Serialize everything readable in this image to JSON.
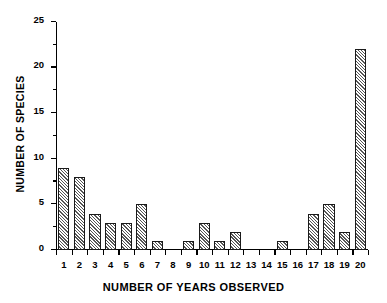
{
  "chart_data": {
    "type": "bar",
    "title": "",
    "xlabel": "NUMBER OF YEARS OBSERVED",
    "ylabel": "NUMBER OF SPECIES",
    "categories": [
      "1",
      "2",
      "3",
      "4",
      "5",
      "6",
      "7",
      "8",
      "9",
      "10",
      "11",
      "12",
      "13",
      "14",
      "15",
      "16",
      "17",
      "18",
      "19",
      "20"
    ],
    "values": [
      9,
      8,
      4,
      3,
      3,
      5,
      1,
      0,
      1,
      3,
      1,
      2,
      0,
      0,
      1,
      0,
      4,
      5,
      2,
      22
    ],
    "ylim": [
      0,
      25
    ],
    "xlim": [
      0,
      20
    ],
    "y_major_ticks": [
      "0",
      "5",
      "10",
      "15",
      "20",
      "25"
    ],
    "y_minor_tick_values": [
      2.5,
      7.5,
      12.5,
      17.5,
      22.5
    ],
    "grid": false,
    "legend": false,
    "legend_position": "none",
    "bar_fill": "hatched-diagonal",
    "bar_edge_color": "#000000",
    "background_color": "#ffffff"
  },
  "axes": {
    "y_title": "NUMBER OF SPECIES",
    "x_title": "NUMBER OF YEARS OBSERVED"
  }
}
